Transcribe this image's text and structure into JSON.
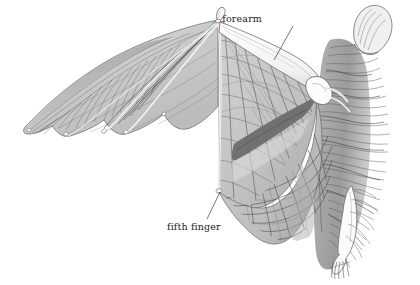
{
  "illustration": {
    "subject": "bat-wing-anatomy",
    "medium": "graphite pencil drawing",
    "background_color": "#ffffff"
  },
  "labels": [
    {
      "id": "forearm",
      "text": "forearm",
      "text_x": 262,
      "text_y": 22,
      "leader_from": [
        293,
        26
      ],
      "leader_to": [
        274,
        60
      ]
    },
    {
      "id": "fifth-finger",
      "text": "fifth finger",
      "text_x": 167,
      "text_y": 230,
      "leader_from": [
        207,
        219
      ],
      "leader_to": [
        220,
        192
      ]
    }
  ],
  "palette": {
    "membrane_light": "#d9d9d9",
    "membrane_mid": "#c4c4c4",
    "membrane_shadow": "#a8a8a8",
    "dark_band": "#6d6d6d",
    "vein": "#4a4a4a",
    "bone_white": "#fbfbfb",
    "bone_outline": "#5a5a5a",
    "fur": "#8c8c8c",
    "fur_dark": "#3f3f3f",
    "label_text": "#1d1d1d",
    "leader_line": "#3a3a3a"
  },
  "anatomy_parts": [
    "forearm",
    "fifth finger",
    "wing membrane",
    "thumb claw",
    "elbow joint",
    "body fur",
    "hind foot"
  ]
}
